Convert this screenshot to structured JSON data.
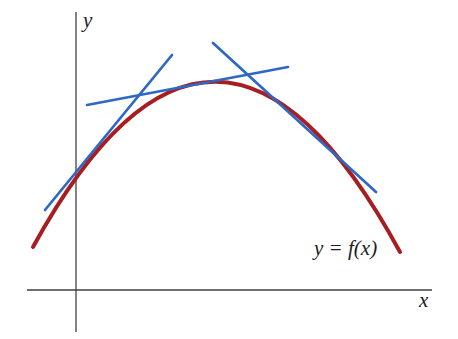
{
  "figure": {
    "background_color": "#ffffff",
    "labels": {
      "y_axis_label": "y",
      "x_axis_label": "x",
      "curve_label": "y = f(x)"
    },
    "axes": {
      "color": "#3f3f3f",
      "y_axis": {
        "x": 76,
        "y1": 12,
        "y2": 332
      },
      "x_axis": {
        "y": 290,
        "x1": 27,
        "x2": 432
      }
    },
    "curve": {
      "type": "parabola-concave-down",
      "color": "#a61e22",
      "stroke_width": 4,
      "start": [
        33,
        247
      ],
      "control": [
        216,
        -86
      ],
      "end": [
        400,
        252
      ],
      "vertex": [
        216,
        82
      ]
    },
    "tangent_lines": {
      "color": "#2d68c6",
      "stroke_width": 2.7,
      "segments": [
        {
          "id": "tangent-lower-left",
          "x1": 45,
          "y1": 210,
          "x2": 172,
          "y2": 55,
          "touch_point": [
            92,
            155
          ]
        },
        {
          "id": "tangent-left-of-apex",
          "x1": 87,
          "y1": 105,
          "x2": 288,
          "y2": 67,
          "touch_point": [
            196,
            84
          ]
        },
        {
          "id": "tangent-right-of-apex",
          "x1": 213,
          "y1": 43,
          "x2": 376,
          "y2": 192,
          "touch_point": [
            308,
            125
          ]
        }
      ]
    }
  }
}
